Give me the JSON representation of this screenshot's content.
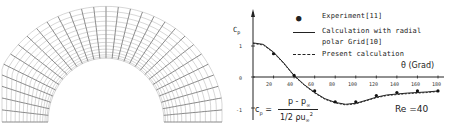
{
  "left_figure": {
    "type": "body-fitted curvilinear grid around semicircular cylinder"
  },
  "chart_data": {
    "type": "line",
    "title": "",
    "xlabel": "θ (Grad)",
    "ylabel": "Cp",
    "xlim": [
      0,
      180
    ],
    "ylim": [
      -1.2,
      1.4
    ],
    "xticks": [
      20,
      40,
      60,
      80,
      100,
      120,
      140,
      160,
      180
    ],
    "yticks": [
      1,
      0,
      -1
    ],
    "grid": false,
    "legend_position": "top-right",
    "series": [
      {
        "name": "Experiment[11]",
        "style": "dots",
        "x": [
          20,
          40,
          60,
          80,
          100,
          120,
          140,
          160,
          180
        ],
        "y": [
          0.75,
          0.05,
          -0.45,
          -0.8,
          -0.8,
          -0.6,
          -0.5,
          -0.45,
          -0.45
        ]
      },
      {
        "name": "Calculation with radial polar Grid[10]",
        "style": "solid",
        "x": [
          0,
          10,
          20,
          30,
          40,
          50,
          60,
          70,
          80,
          90,
          100,
          110,
          120,
          130,
          140,
          150,
          160,
          170,
          180
        ],
        "y": [
          1.1,
          1.05,
          0.8,
          0.45,
          0.05,
          -0.25,
          -0.5,
          -0.7,
          -0.82,
          -0.88,
          -0.85,
          -0.75,
          -0.65,
          -0.58,
          -0.55,
          -0.52,
          -0.5,
          -0.48,
          -0.45
        ]
      },
      {
        "name": "Present calculation",
        "style": "dashed",
        "x": [
          0,
          10,
          20,
          30,
          40,
          50,
          60,
          70,
          80,
          90,
          100,
          110,
          120,
          130,
          140,
          150,
          160,
          170,
          180
        ],
        "y": [
          1.1,
          1.05,
          0.8,
          0.45,
          0.05,
          -0.25,
          -0.5,
          -0.7,
          -0.82,
          -0.88,
          -0.85,
          -0.75,
          -0.65,
          -0.58,
          -0.55,
          -0.52,
          -0.5,
          -0.48,
          -0.45
        ]
      }
    ],
    "annotations": [
      "Cp = (p - p∞) / (1/2 ρ u∞²)",
      "Re = 40"
    ]
  },
  "labels": {
    "ylabel": "C",
    "ylabel_sub": "p",
    "xlabel": "θ (Grad)",
    "legend": {
      "experiment": "Experiment[11]",
      "calc_line1": "Calculation with radial",
      "calc_line2": "polar Grid[10]",
      "present": "Present calculation"
    },
    "formula": {
      "lhs": "c",
      "lhs_sub": "p",
      "eq": "=",
      "numerator": "p - p",
      "numerator_sub": "∞",
      "denominator": "1/2 ρu",
      "denominator_sub": "∞",
      "denominator_sup": "2"
    },
    "reynolds": "Re =40",
    "yticks": [
      "1",
      "0",
      "-1"
    ],
    "xticks": [
      "20",
      "40",
      "60",
      "80",
      "100",
      "120",
      "140",
      "160",
      "180"
    ]
  }
}
